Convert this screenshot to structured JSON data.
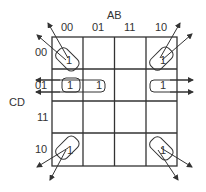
{
  "axis": {
    "columns_var": "AB",
    "rows_var": "CD"
  },
  "columns": [
    "00",
    "01",
    "11",
    "10"
  ],
  "rows": [
    "00",
    "01",
    "11",
    "10"
  ],
  "cells": [
    [
      "1",
      "",
      "",
      "1"
    ],
    [
      "1",
      "1",
      "",
      "1"
    ],
    [
      "",
      "",
      "",
      ""
    ],
    [
      "1",
      "",
      "",
      "1"
    ]
  ],
  "groups": [
    {
      "name": "corners",
      "cells": [
        "00-00",
        "00-10",
        "10-00",
        "10-10"
      ]
    },
    {
      "name": "row-01-wrap",
      "cells": [
        "01-00",
        "01-01",
        "01-10"
      ]
    },
    {
      "name": "single-01-00",
      "cells": [
        "01-00"
      ]
    }
  ]
}
